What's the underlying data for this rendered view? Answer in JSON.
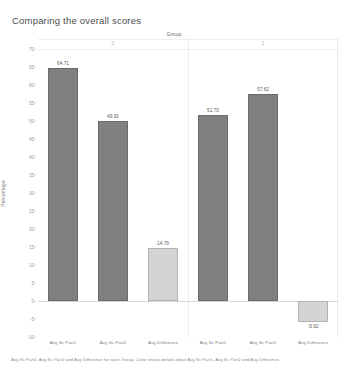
{
  "title": "Comparing the overall scores",
  "group_field_label": "Group",
  "group_headers": [
    "0",
    "1"
  ],
  "caption": "Avg Sc Part1, Avg Sc Part2 and Avg Difference for each Group. Color shows details about Avg Sc Part1, Avg Sc Part2 and Avg Difference.",
  "colors": {
    "bar_dark": "#808080",
    "bar_light": "#d4d4d4",
    "bar_dark_border": "#6b6b6b",
    "bar_light_border": "#b3b3b3",
    "gridline": "#ececec",
    "axis_text": "#9a9a9a",
    "title_text": "#4d4d4d"
  },
  "chart_data": {
    "type": "bar",
    "title": "Comparing the overall scores",
    "xlabel": "Group",
    "ylabel": "Percentage",
    "ylim": [
      -10,
      70
    ],
    "ytick_step": 5,
    "yticks": [
      "70",
      "65",
      "60",
      "55",
      "50",
      "45",
      "40",
      "35",
      "30",
      "25",
      "20",
      "15",
      "10",
      "5",
      "0",
      "-5",
      "-10"
    ],
    "grid": false,
    "legend": "none",
    "categories": [
      "Avg Sc Part1",
      "Avg Sc Part2",
      "Avg Difference"
    ],
    "panes": [
      {
        "group": "0",
        "bars": [
          {
            "category": "Avg Sc Part1",
            "value": 64.71,
            "label": "64.71",
            "shade": "dark"
          },
          {
            "category": "Avg Sc Part2",
            "value": 49.91,
            "label": "49.91",
            "shade": "dark"
          },
          {
            "category": "Avg Difference",
            "value": 14.79,
            "label": "14.79",
            "shade": "light"
          }
        ]
      },
      {
        "group": "1",
        "bars": [
          {
            "category": "Avg Sc Part1",
            "value": 51.7,
            "label": "51.70",
            "shade": "dark"
          },
          {
            "category": "Avg Sc Part2",
            "value": 57.62,
            "label": "57.62",
            "shade": "dark"
          },
          {
            "category": "Avg Difference",
            "value": -5.92,
            "label": "-5.92",
            "shade": "light"
          }
        ]
      }
    ]
  }
}
